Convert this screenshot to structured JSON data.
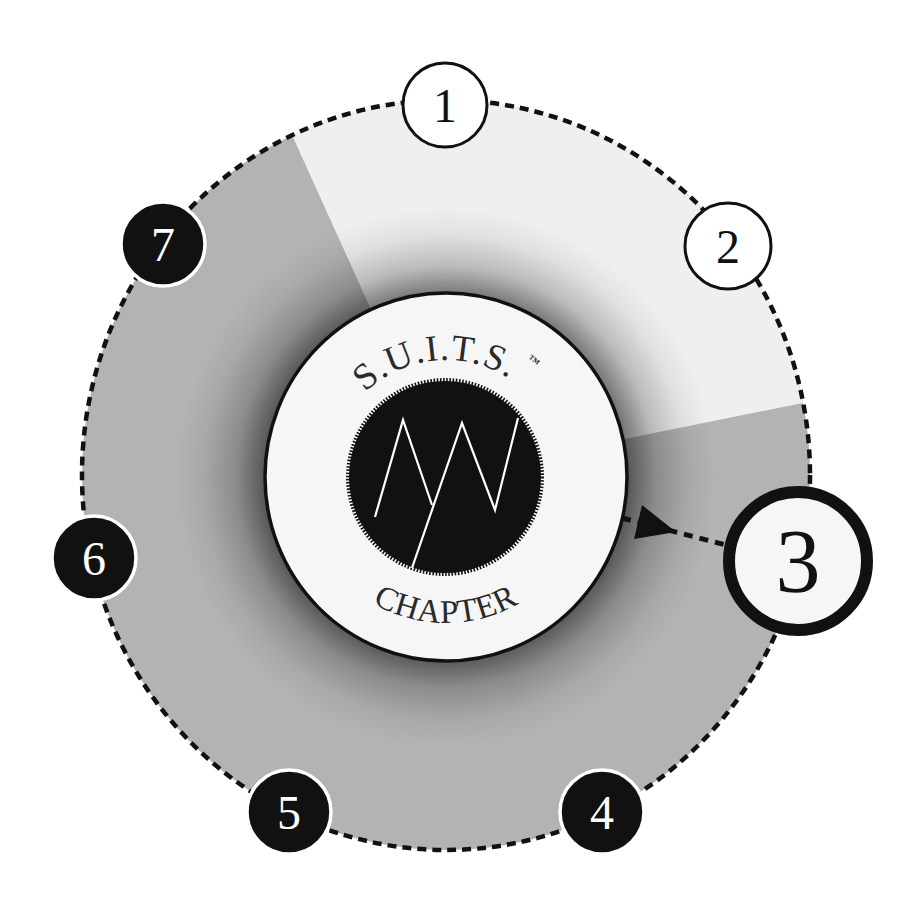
{
  "diagram": {
    "hub": {
      "title_top": "S.U.I.T.S.",
      "trademark": "™",
      "title_bottom": "CHAPTER",
      "logo": "zigzag-mountain-emblem"
    },
    "steps": [
      {
        "label": "1",
        "style": "outlined",
        "region": "light-wedge"
      },
      {
        "label": "2",
        "style": "outlined",
        "region": "light-wedge"
      },
      {
        "label": "3",
        "style": "highlighted-current",
        "region": "gray"
      },
      {
        "label": "4",
        "style": "filled-black",
        "region": "gray"
      },
      {
        "label": "5",
        "style": "filled-black",
        "region": "gray"
      },
      {
        "label": "6",
        "style": "filled-black",
        "region": "gray"
      },
      {
        "label": "7",
        "style": "filled-black",
        "region": "gray"
      }
    ],
    "current_step": "3",
    "pointer": "dashed-arrow-hub-to-step-3"
  },
  "colors": {
    "background": "#ffffff",
    "ring_gray": "#b3b3b3",
    "ring_light_wedge": "#efefef",
    "hub_fill": "#f6f6f6",
    "ink": "#111111",
    "emblem_stroke": "#ffffff"
  }
}
